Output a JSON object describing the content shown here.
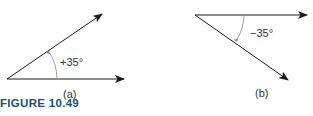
{
  "figure": {
    "caption": "FIGURE 10.49",
    "panels": [
      {
        "id": "a",
        "label": "(a)",
        "angle_label": "+35°",
        "angle_deg": 35
      },
      {
        "id": "b",
        "label": "(b)",
        "angle_label": "−35°",
        "angle_deg": -35
      }
    ],
    "colors": {
      "line": "#1a1a1a",
      "arc": "#8a8a8a",
      "caption": "#1a4f7a"
    }
  }
}
